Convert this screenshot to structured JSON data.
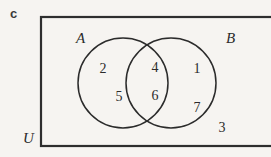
{
  "figure": {
    "part_label": "c",
    "universal_set_label": "U",
    "set_a_label": "A",
    "set_b_label": "B",
    "regions": {
      "a_only": [
        "2",
        "5"
      ],
      "intersection": [
        "4",
        "6"
      ],
      "b_only": [
        "1",
        "7"
      ],
      "outside": [
        "3"
      ]
    },
    "elements": [
      {
        "value": "2",
        "region": "a_only",
        "x": 103,
        "y": 62
      },
      {
        "value": "5",
        "region": "a_only",
        "x": 119,
        "y": 90
      },
      {
        "value": "4",
        "region": "intersection",
        "x": 155,
        "y": 61
      },
      {
        "value": "6",
        "region": "intersection",
        "x": 155,
        "y": 89
      },
      {
        "value": "1",
        "region": "b_only",
        "x": 197,
        "y": 62
      },
      {
        "value": "7",
        "region": "b_only",
        "x": 197,
        "y": 101
      },
      {
        "value": "3",
        "region": "outside",
        "x": 222,
        "y": 121
      }
    ],
    "colors": {
      "background": "#f6f4f1",
      "stroke": "#2b2b2b",
      "rect_stroke": "#2e2e2e",
      "text": "#2b2b2b"
    },
    "geometry": {
      "rect": {
        "x": 41,
        "y": 17,
        "width": 238,
        "height": 129
      },
      "circle_a": {
        "cx": 123,
        "cy": 83,
        "r": 45
      },
      "circle_b": {
        "cx": 171,
        "cy": 83,
        "r": 45
      }
    }
  }
}
